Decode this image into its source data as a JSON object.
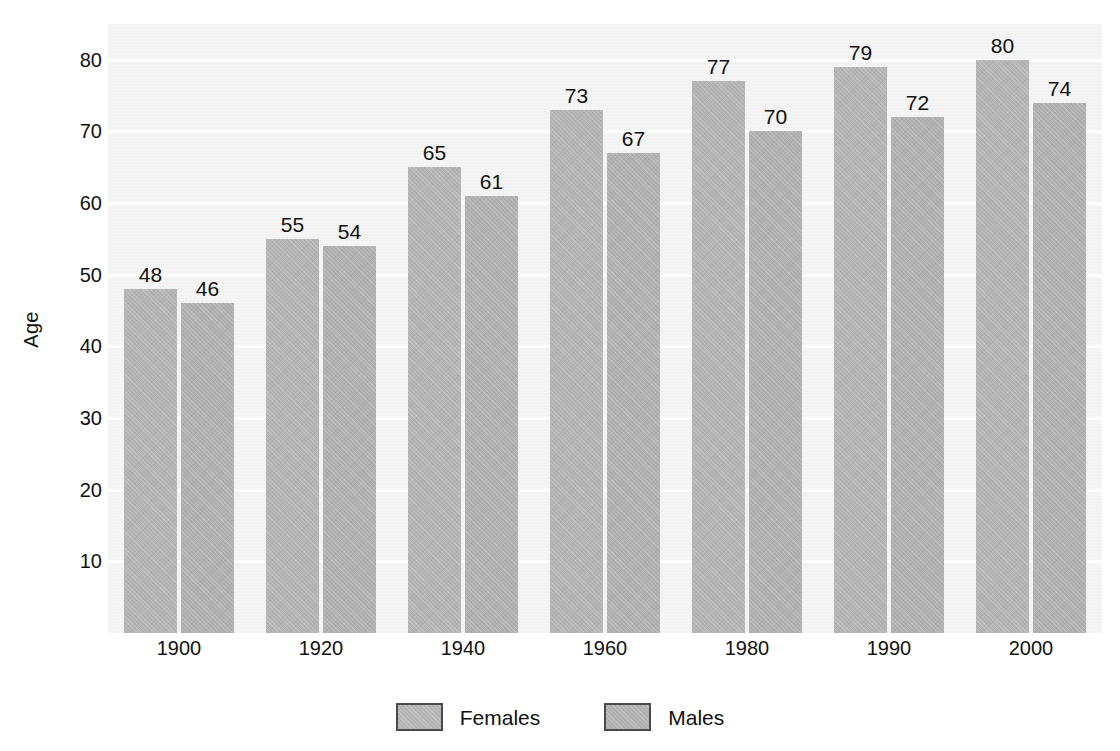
{
  "chart_data": {
    "type": "bar",
    "title": "",
    "xlabel": "",
    "ylabel": "Age",
    "categories": [
      "1900",
      "1920",
      "1940",
      "1960",
      "1980",
      "1990",
      "2000"
    ],
    "series": [
      {
        "name": "Females",
        "values": [
          48,
          55,
          65,
          73,
          77,
          79,
          80
        ],
        "color": "#b4b4b4"
      },
      {
        "name": "Males",
        "values": [
          46,
          54,
          61,
          67,
          70,
          72,
          74
        ],
        "color": "#b0b0b0"
      }
    ],
    "ylim": [
      0,
      85
    ],
    "yticks": [
      10,
      20,
      30,
      40,
      50,
      60,
      70,
      80
    ],
    "ytick_labels": [
      "10",
      "20",
      "30",
      "40",
      "50",
      "60",
      "70",
      "80"
    ],
    "grid": true,
    "grid_color": "#ffffff",
    "legend_position": "bottom",
    "plot_background": "#f2f2f2",
    "page_background": "#ffffff",
    "data_labels": true
  },
  "legend": {
    "items": [
      {
        "label": "Females",
        "color": "#b4b4b4"
      },
      {
        "label": "Males",
        "color": "#b0b0b0"
      }
    ]
  }
}
